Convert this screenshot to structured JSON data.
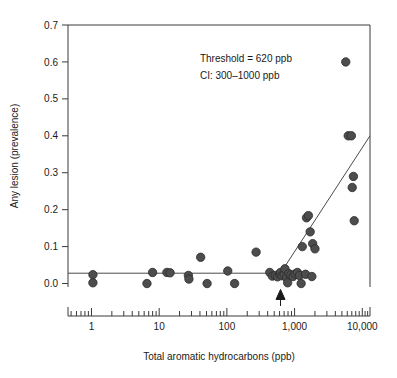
{
  "chart_data": {
    "type": "scatter",
    "title": "",
    "xlabel": "Total aromatic hydrocarbons (ppb)",
    "ylabel": "Any lesion (prevalence)",
    "xscale": "log",
    "xlim": [
      0.45,
      13000
    ],
    "ylim": [
      -0.05,
      0.7
    ],
    "yticks": [
      "0.0",
      "0.1",
      "0.2",
      "0.3",
      "0.4",
      "0.5",
      "0.6",
      "0.7"
    ],
    "ytick_values": [
      0.0,
      0.1,
      0.2,
      0.3,
      0.4,
      0.5,
      0.6,
      0.7
    ],
    "xticks": [
      "1",
      "10",
      "100",
      "1,000",
      "10,000"
    ],
    "xtick_values": [
      1,
      10,
      100,
      1000,
      10000
    ],
    "grid": false,
    "legend": null,
    "annotations": [
      {
        "text": "Threshold = 620 ppb",
        "x": 40,
        "y": 0.6
      },
      {
        "text": "CI: 300–1000 ppb",
        "x": 40,
        "y": 0.555
      }
    ],
    "threshold": {
      "value": 620,
      "ci_low": 300,
      "ci_high": 1000,
      "marker": "up-arrow",
      "arrow_y": -0.035
    },
    "fit": {
      "description": "hockey-stick threshold fit: flat at 0.028 below threshold, rising linearly in log10(x) above",
      "plateau": 0.028,
      "breakpoint_x": 620,
      "end_x": 13000,
      "end_y": 0.4
    },
    "points": [
      {
        "x": 1.05,
        "y": 0.024
      },
      {
        "x": 1.05,
        "y": 0.002
      },
      {
        "x": 6.6,
        "y": 0.0
      },
      {
        "x": 8.0,
        "y": 0.03
      },
      {
        "x": 13.0,
        "y": 0.03
      },
      {
        "x": 14.5,
        "y": 0.029
      },
      {
        "x": 27.0,
        "y": 0.022
      },
      {
        "x": 27.5,
        "y": 0.012
      },
      {
        "x": 41.0,
        "y": 0.071
      },
      {
        "x": 51.0,
        "y": 0.0
      },
      {
        "x": 103.0,
        "y": 0.034
      },
      {
        "x": 130.0,
        "y": 0.0
      },
      {
        "x": 270.0,
        "y": 0.085
      },
      {
        "x": 430.0,
        "y": 0.03
      },
      {
        "x": 470.0,
        "y": 0.02
      },
      {
        "x": 520.0,
        "y": 0.022
      },
      {
        "x": 560.0,
        "y": 0.018
      },
      {
        "x": 600.0,
        "y": 0.026
      },
      {
        "x": 620.0,
        "y": 0.03
      },
      {
        "x": 650.0,
        "y": 0.021
      },
      {
        "x": 700.0,
        "y": 0.024
      },
      {
        "x": 720.0,
        "y": 0.04
      },
      {
        "x": 760.0,
        "y": 0.016
      },
      {
        "x": 790.0,
        "y": 0.002
      },
      {
        "x": 820.0,
        "y": 0.027
      },
      {
        "x": 880.0,
        "y": 0.023
      },
      {
        "x": 950.0,
        "y": 0.019
      },
      {
        "x": 1020.0,
        "y": 0.026
      },
      {
        "x": 1100.0,
        "y": 0.03
      },
      {
        "x": 1180.0,
        "y": 0.022
      },
      {
        "x": 1250.0,
        "y": 0.0
      },
      {
        "x": 1300.0,
        "y": 0.1
      },
      {
        "x": 1450.0,
        "y": 0.025
      },
      {
        "x": 1500.0,
        "y": 0.178
      },
      {
        "x": 1600.0,
        "y": 0.184
      },
      {
        "x": 1700.0,
        "y": 0.14
      },
      {
        "x": 1800.0,
        "y": 0.019
      },
      {
        "x": 1850.0,
        "y": 0.108
      },
      {
        "x": 2000.0,
        "y": 0.094
      },
      {
        "x": 5700.0,
        "y": 0.6
      },
      {
        "x": 6200.0,
        "y": 0.4
      },
      {
        "x": 6900.0,
        "y": 0.4
      },
      {
        "x": 7100.0,
        "y": 0.26
      },
      {
        "x": 7400.0,
        "y": 0.29
      },
      {
        "x": 7600.0,
        "y": 0.17
      }
    ],
    "minor_tick_decades": [
      [
        0.5,
        0.6,
        0.7,
        0.8,
        0.9
      ],
      [
        2,
        3,
        4,
        5,
        6,
        7,
        8,
        9
      ],
      [
        20,
        30,
        40,
        50,
        60,
        70,
        80,
        90
      ],
      [
        200,
        300,
        400,
        500,
        600,
        700,
        800,
        900
      ],
      [
        2000,
        3000,
        4000,
        5000,
        6000,
        7000,
        8000,
        9000
      ],
      [
        11000,
        12000
      ]
    ]
  }
}
